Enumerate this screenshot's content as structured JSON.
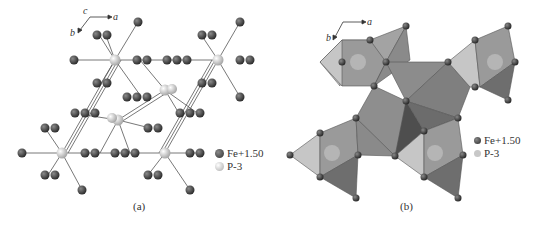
{
  "figure": {
    "panels": [
      {
        "id": "a",
        "caption": "(a)",
        "style": "ball-and-stick",
        "axes": {
          "c": "c",
          "a": "a",
          "b": "b"
        },
        "legend": [
          {
            "label": "Fe+1.50",
            "color": "#4a4a4a"
          },
          {
            "label": "P-3",
            "color": "#e6e6e6"
          }
        ]
      },
      {
        "id": "b",
        "caption": "(b)",
        "style": "polyhedral",
        "axes": {
          "a": "a",
          "b": "b"
        },
        "legend": [
          {
            "label": "Fe+1.50",
            "color": "#4a4a4a"
          },
          {
            "label": "P-3",
            "color": "#c8c8c8"
          }
        ]
      }
    ]
  }
}
